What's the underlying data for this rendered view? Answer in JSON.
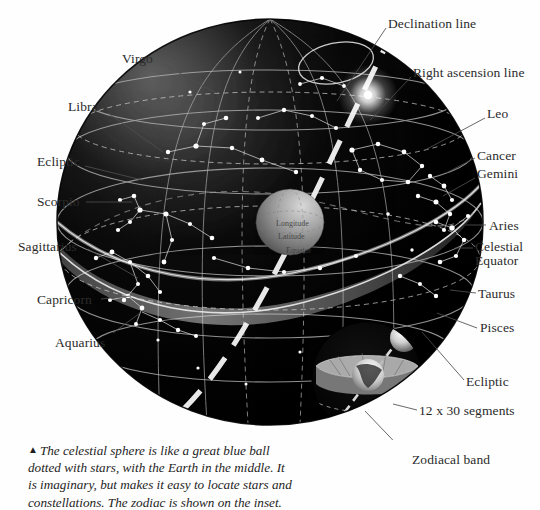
{
  "figure": {
    "colors": {
      "page_background": "#fefefe",
      "sphere_dark": "#050505",
      "sphere_edge": "#151515",
      "grid_line": "#b9b9b9",
      "star": "#ffffff",
      "zodiac_band": "#9a9a9a",
      "earth_globe": "#8e8e8e",
      "label_text": "#2b2b2b",
      "leader_line": "#555555",
      "ecliptic_white": "#f2f2f2"
    },
    "labels_left": [
      {
        "name": "virgo",
        "text": "Virgo",
        "x": 122,
        "y": 52,
        "lx1": 163,
        "ly1": 64,
        "lx2": 216,
        "ly2": 93
      },
      {
        "name": "libra",
        "text": "Libra",
        "x": 68,
        "y": 100,
        "lx1": 108,
        "ly1": 113,
        "lx2": 163,
        "ly2": 152
      },
      {
        "name": "ecliptic",
        "text": "Ecliptic",
        "x": 37,
        "y": 155,
        "lx1": 85,
        "ly1": 166,
        "lx2": 142,
        "ly2": 180
      },
      {
        "name": "scorpio",
        "text": "Scorpio",
        "x": 37,
        "y": 195,
        "lx1": 86,
        "ly1": 202,
        "lx2": 132,
        "ly2": 202
      },
      {
        "name": "sagittarius",
        "text": "Sagittarius",
        "x": 18,
        "y": 240,
        "lx1": 88,
        "ly1": 249,
        "lx2": 138,
        "ly2": 278
      },
      {
        "name": "capricorn",
        "text": "Capricorn",
        "x": 37,
        "y": 293,
        "lx1": 101,
        "ly1": 299,
        "lx2": 131,
        "ly2": 296
      },
      {
        "name": "aquarius",
        "text": "Aquarius",
        "x": 55,
        "y": 336,
        "lx1": 113,
        "ly1": 333,
        "lx2": 140,
        "ly2": 313
      }
    ],
    "labels_right": [
      {
        "name": "declination-line",
        "text": "Declination line",
        "x": 388,
        "y": 17,
        "lx1": 386,
        "ly1": 28,
        "lx2": 337,
        "ly2": 101
      },
      {
        "name": "right-ascension-line",
        "text": "Right ascension line",
        "x": 413,
        "y": 66,
        "lx1": 411,
        "ly1": 77,
        "lx2": 370,
        "ly2": 120
      },
      {
        "name": "leo",
        "text": "Leo",
        "x": 487,
        "y": 107,
        "lx1": 485,
        "ly1": 118,
        "lx2": 425,
        "ly2": 150
      },
      {
        "name": "cancer",
        "text": "Cancer",
        "x": 477,
        "y": 149,
        "lx1": 475,
        "ly1": 158,
        "lx2": 446,
        "ly2": 173
      },
      {
        "name": "gemini",
        "text": "Gemini",
        "x": 477,
        "y": 167,
        "lx1": 475,
        "ly1": 178,
        "lx2": 443,
        "ly2": 196
      },
      {
        "name": "aries",
        "text": "Aries",
        "x": 489,
        "y": 219,
        "lx1": 486,
        "ly1": 225,
        "lx2": 466,
        "ly2": 225
      },
      {
        "name": "celestial-equator",
        "text": "Celestial\nEquator",
        "x": 475,
        "y": 240,
        "lx1": 473,
        "ly1": 248,
        "lx2": 455,
        "ly2": 248
      },
      {
        "name": "taurus",
        "text": "Taurus",
        "x": 478,
        "y": 287,
        "lx1": 476,
        "ly1": 293,
        "lx2": 450,
        "ly2": 290
      },
      {
        "name": "pisces",
        "text": "Pisces",
        "x": 480,
        "y": 321,
        "lx1": 477,
        "ly1": 328,
        "lx2": 437,
        "ly2": 313
      },
      {
        "name": "ecliptic-right",
        "text": "Ecliptic",
        "x": 466,
        "y": 375,
        "lx1": 464,
        "ly1": 380,
        "lx2": 422,
        "ly2": 332
      },
      {
        "name": "twelve-segments",
        "text": "12 x 30 segments",
        "x": 419,
        "y": 404,
        "lx1": 417,
        "ly1": 410,
        "lx2": 393,
        "ly2": 404
      },
      {
        "name": "zodiacal-band",
        "text": "Zodiacal band",
        "x": 412,
        "y": 459,
        "lx1": 410,
        "ly1": 458,
        "lx2": 365,
        "ly2": 411
      }
    ],
    "earth_labels": [
      {
        "name": "longitude-label",
        "text": "Longitude",
        "x": 276,
        "y": 222
      },
      {
        "name": "latitude-label",
        "text": "Latitude",
        "x": 278,
        "y": 235
      },
      {
        "name": "equator-label",
        "text": "Equator",
        "x": 286,
        "y": 249
      }
    ]
  },
  "caption": {
    "triangle": "▲",
    "text": "The celestial sphere is like a great blue ball dotted with stars, with the Earth in the middle. It is imaginary, but makes it easy to locate stars and constellations. The zodiac is shown on the inset."
  }
}
